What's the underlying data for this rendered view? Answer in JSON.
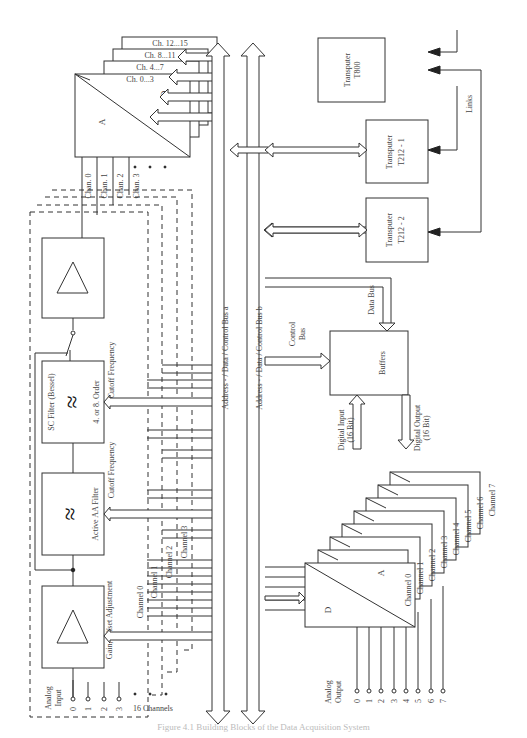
{
  "figure": {
    "caption": "Figure 4.1 Building Blocks of the Data Acquisition System",
    "orientation": "rotated 90° counter-clockwise"
  },
  "adc_stack": {
    "labels": [
      "Ch. 0...3",
      "Ch. 4...7",
      "Ch. 8...11",
      "Ch. 12...15"
    ],
    "a_label": "A",
    "d_label": "D",
    "channel_inputs": [
      "Chan. 0",
      "Chan. 1",
      "Chan. 2",
      "Chan. 3"
    ]
  },
  "signal_chain": {
    "gain_block_label": "Gain, Offset Adjustment",
    "aa_filter_label": "Active AA Filter",
    "aa_cutoff_label": "Cutoff Frequency",
    "sc_filter_label": "SC Filter (Bessel)",
    "sc_order_label": "4. or 8. Order",
    "sc_cutoff_label": "Cutoff Frequency",
    "control_channels": [
      "Channel 0",
      "Channel 1",
      "Channel 2",
      "Channel 3"
    ]
  },
  "analog_input": {
    "label_line1": "Analog",
    "label_line2": "Input",
    "pins": [
      "0",
      "1",
      "2",
      "3"
    ],
    "ellipsis": ". . .",
    "count_label": "16 Channels"
  },
  "buses": {
    "bus_a": "Address - / Data / Control Bus a",
    "bus_b": "Address - / Data / Control Bus b",
    "control_bus_line1": "Control",
    "control_bus_line2": "Bus",
    "data_bus": "Data Bus"
  },
  "transputers": [
    {
      "line1": "Transputer",
      "line2": "T800"
    },
    {
      "line1": "Transputer",
      "line2": "T212 - 1"
    },
    {
      "line1": "Transputer",
      "line2": "T212 - 2"
    }
  ],
  "links_label": "Links",
  "buffers": {
    "label": "Buffers",
    "digital_input_line1": "Digital Input",
    "digital_input_line2": "(16 Bit)",
    "digital_output_line1": "Digital Output",
    "digital_output_line2": "(16 Bit)"
  },
  "dac_stack": {
    "a_label": "A",
    "d_label": "D",
    "channels": [
      "Channel 0",
      "Channel 1",
      "Channel 2",
      "Channel 3",
      "Channel 4",
      "Channel 5",
      "Channel 6",
      "Channel 7"
    ]
  },
  "analog_output": {
    "label_line1": "Analog",
    "label_line2": "Output",
    "pins": [
      "0",
      "1",
      "2",
      "3",
      "4",
      "5",
      "6",
      "7"
    ]
  },
  "colors": {
    "line": "#333333",
    "text": "#444444",
    "background": "#ffffff"
  }
}
